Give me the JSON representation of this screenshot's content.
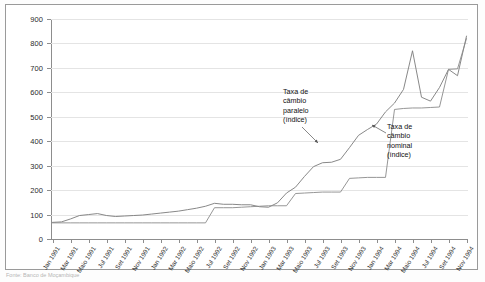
{
  "figure": {
    "source_note": "Fonte: Banco de Moçambique"
  },
  "annotations": [
    {
      "name": "taxa-cambio-paralelo",
      "lines": [
        "Taxa de",
        "câmbio",
        "paralelo",
        "(índice)"
      ]
    },
    {
      "name": "taxa-cambio-nominal",
      "lines": [
        "Taxa de",
        "câmbio",
        "nominal",
        "(índice)"
      ]
    }
  ],
  "chart_data": {
    "type": "line",
    "title": "",
    "xlabel": "",
    "ylabel": "",
    "ylim": [
      0,
      900
    ],
    "yticks": [
      0,
      100,
      200,
      300,
      400,
      500,
      600,
      700,
      800,
      900
    ],
    "grid": true,
    "legend_position": "inline-annotations",
    "categories": [
      "Jan 1991",
      "Fev 1991",
      "Mar 1991",
      "Abr 1991",
      "Maio 1991",
      "Jun 1991",
      "Jul 1991",
      "Ago 1991",
      "Set 1991",
      "Out 1991",
      "Nov 1991",
      "Dez 1991",
      "Jan 1992",
      "Fev 1992",
      "Mar 1992",
      "Abr 1992",
      "Maio 1992",
      "Jun 1992",
      "Jul 1992",
      "Ago 1992",
      "Set 1992",
      "Out 1992",
      "Nov 1992",
      "Dez 1992",
      "Jan 1993",
      "Fev 1993",
      "Mar 1993",
      "Abr 1993",
      "Maio 1993",
      "Jun 1993",
      "Jul 1993",
      "Ago 1993",
      "Set 1993",
      "Out 1993",
      "Nov 1993",
      "Dez 1993",
      "Jan 1994",
      "Fev 1994",
      "Mar 1994",
      "Abr 1994",
      "Maio 1994",
      "Jun 1994",
      "Jul 1994",
      "Ago 1994",
      "Set 1994",
      "Out 1994",
      "Nov 1994"
    ],
    "xtick_labels": [
      "Jan 1991",
      "Mar 1991",
      "Maio 1991",
      "Jul 1991",
      "Set 1991",
      "Nov 1991",
      "Jan 1992",
      "Mar 1992",
      "Maio 1992",
      "Jul 1992",
      "Set 1992",
      "Nov 1992",
      "Jan 1993",
      "Mar 1993",
      "Maio 1993",
      "Jul 1993",
      "Set 1993",
      "Nov 1993",
      "Jan 1994",
      "Mar 1994",
      "Maio 1994",
      "Jul 1994",
      "Set 1994",
      "Nov 1994"
    ],
    "xtick_indices": [
      0,
      2,
      4,
      6,
      8,
      10,
      12,
      14,
      16,
      18,
      20,
      22,
      24,
      26,
      28,
      30,
      32,
      34,
      36,
      38,
      40,
      42,
      44,
      46
    ],
    "series": [
      {
        "name": "Taxa de câmbio paralelo (índice)",
        "color": "#7a7a7a",
        "values": [
          68,
          70,
          82,
          96,
          100,
          104,
          96,
          92,
          94,
          96,
          98,
          102,
          106,
          110,
          114,
          120,
          126,
          134,
          146,
          142,
          142,
          140,
          140,
          132,
          130,
          148,
          188,
          212,
          256,
          296,
          312,
          314,
          326,
          374,
          424,
          448,
          470,
          520,
          556,
          612,
          770,
          580,
          564,
          620,
          694,
          668,
          830
        ]
      },
      {
        "name": "Taxa de câmbio nominal (índice)",
        "color": "#8a8a8a",
        "values": [
          66,
          66,
          66,
          66,
          66,
          66,
          66,
          66,
          66,
          66,
          66,
          66,
          66,
          66,
          66,
          66,
          66,
          66,
          128,
          128,
          128,
          130,
          132,
          134,
          136,
          136,
          136,
          186,
          188,
          190,
          192,
          192,
          192,
          248,
          250,
          252,
          252,
          252,
          530,
          534,
          536,
          536,
          538,
          540,
          694,
          696,
          820
        ]
      }
    ]
  }
}
